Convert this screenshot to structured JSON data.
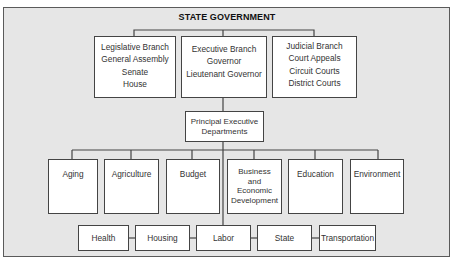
{
  "title": "STATE GOVERNMENT",
  "branches": [
    {
      "name": "Legislative Branch",
      "lines": [
        "Legislative Branch",
        "General Assembly",
        "Senate",
        "House"
      ]
    },
    {
      "name": "Executive Branch",
      "lines": [
        "Executive Branch",
        "Governor",
        "Lieutenant Governor"
      ]
    },
    {
      "name": "Judicial Branch",
      "lines": [
        "Judicial Branch",
        "Court Appeals",
        "Circuit Courts",
        "District Courts"
      ]
    }
  ],
  "principal": {
    "lines": [
      "Principal Executive",
      "Departments"
    ]
  },
  "departments_row1": [
    {
      "lines": [
        "Aging"
      ]
    },
    {
      "lines": [
        "Agriculture"
      ]
    },
    {
      "lines": [
        "Budget"
      ]
    },
    {
      "lines": [
        "Business",
        "and",
        "Economic",
        "Development"
      ]
    },
    {
      "lines": [
        "Education"
      ]
    },
    {
      "lines": [
        "Environment"
      ]
    }
  ],
  "departments_row2": [
    "Health",
    "Housing",
    "Labor",
    "State",
    "Transportation"
  ]
}
